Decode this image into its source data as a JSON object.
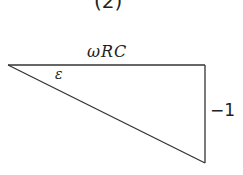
{
  "diagram": {
    "caption": "(2)",
    "type": "right-triangle",
    "labels": {
      "top_side": "ωRC",
      "angle": "ε",
      "right_side": "−1"
    },
    "vertices": {
      "left": [
        8,
        65
      ],
      "top_right": [
        205,
        65
      ],
      "bottom_right": [
        205,
        163
      ]
    },
    "stroke_color": "#333333"
  }
}
